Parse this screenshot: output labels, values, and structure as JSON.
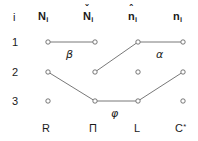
{
  "figure": {
    "type": "lattice-diagram",
    "background": "#ffffff",
    "node_stroke": "#555555",
    "edge_stroke": "#555555",
    "text_color": "#1a1a1a"
  },
  "header": {
    "row_index_label": "i",
    "columns": [
      {
        "base": "N",
        "accent": "",
        "subscript": "i",
        "bold": true,
        "text": "N_i"
      },
      {
        "base": "N",
        "accent": "ˇ",
        "subscript": "i",
        "bold": true,
        "text": "Ň_i"
      },
      {
        "base": "n",
        "accent": "ˆ",
        "subscript": "i",
        "bold": true,
        "text": "n̂_i"
      },
      {
        "base": "n",
        "accent": "",
        "subscript": "i",
        "bold": true,
        "text": "n_i"
      }
    ]
  },
  "rows": [
    {
      "label": "1"
    },
    {
      "label": "2"
    },
    {
      "label": "3"
    }
  ],
  "footer": {
    "columns": [
      {
        "text": "R",
        "superscript": ""
      },
      {
        "text": "Π",
        "superscript": ""
      },
      {
        "text": "L",
        "superscript": ""
      },
      {
        "text": "C",
        "superscript": "*"
      }
    ]
  },
  "chart_data": {
    "type": "scatter",
    "title": "",
    "xlabel": "",
    "ylabel": "",
    "grid": false,
    "legend": "none",
    "column_x": [
      48,
      95,
      138,
      183
    ],
    "row_y": [
      42,
      72,
      101
    ],
    "columns": [
      "N_i",
      "Ň_i",
      "n̂_i",
      "n_i"
    ],
    "rows": [
      "1",
      "2",
      "3"
    ],
    "nodes": [
      {
        "id": "c1r1",
        "col": 1,
        "row": 1,
        "x": 48,
        "y": 42
      },
      {
        "id": "c2r1",
        "col": 2,
        "row": 1,
        "x": 95,
        "y": 42
      },
      {
        "id": "c3r1",
        "col": 3,
        "row": 1,
        "x": 138,
        "y": 42
      },
      {
        "id": "c4r1",
        "col": 4,
        "row": 1,
        "x": 183,
        "y": 42
      },
      {
        "id": "c1r2",
        "col": 1,
        "row": 2,
        "x": 48,
        "y": 72
      },
      {
        "id": "c2r2",
        "col": 2,
        "row": 2,
        "x": 95,
        "y": 72
      },
      {
        "id": "c3r2",
        "col": 3,
        "row": 2,
        "x": 138,
        "y": 72
      },
      {
        "id": "c4r2",
        "col": 4,
        "row": 2,
        "x": 183,
        "y": 72
      },
      {
        "id": "c1r3",
        "col": 1,
        "row": 3,
        "x": 48,
        "y": 101
      },
      {
        "id": "c2r3",
        "col": 2,
        "row": 3,
        "x": 95,
        "y": 101
      },
      {
        "id": "c3r3",
        "col": 3,
        "row": 3,
        "x": 138,
        "y": 101
      },
      {
        "id": "c4r3",
        "col": 4,
        "row": 3,
        "x": 183,
        "y": 101
      }
    ],
    "edges": [
      {
        "from": "c1r1",
        "to": "c2r1",
        "label": "β",
        "label_x": 71,
        "label_y": 54
      },
      {
        "from": "c3r1",
        "to": "c4r1",
        "label": "α",
        "label_x": 161,
        "label_y": 54
      },
      {
        "from": "c2r2",
        "to": "c3r1",
        "label": "",
        "label_x": 0,
        "label_y": 0
      },
      {
        "from": "c1r2",
        "to": "c2r3",
        "label": "",
        "label_x": 0,
        "label_y": 0
      },
      {
        "from": "c2r3",
        "to": "c3r3",
        "label": "φ",
        "label_x": 116,
        "label_y": 113
      },
      {
        "from": "c3r3",
        "to": "c4r2",
        "label": "",
        "label_x": 0,
        "label_y": 0
      }
    ],
    "annotations": [
      {
        "text": "β",
        "x": 71,
        "y": 54
      },
      {
        "text": "α",
        "x": 161,
        "y": 54
      },
      {
        "text": "φ",
        "x": 116,
        "y": 113
      }
    ]
  }
}
